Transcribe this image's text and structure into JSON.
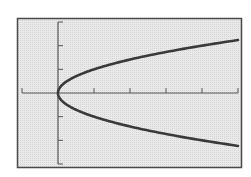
{
  "colors": {
    "background": "#ffffff",
    "screen": "#e6e6e6",
    "frame": "#4a4a4a",
    "axis": "#555555",
    "curve": "#3a3a3a"
  },
  "chart_data": {
    "type": "line",
    "title": "",
    "xlabel": "",
    "ylabel": "",
    "equation": "y^2 = x",
    "xlim": [
      -1,
      5
    ],
    "ylim": [
      -3,
      3
    ],
    "xscale": 1,
    "yscale": 1,
    "grid": false,
    "legend": null,
    "x_ticks": [
      -1,
      1,
      2,
      3,
      4,
      5
    ],
    "y_ticks": [
      -3,
      -2,
      -1,
      1,
      2,
      3
    ],
    "series": [
      {
        "name": "upper branch y = sqrt(x)",
        "x": [
          0,
          0.25,
          0.5,
          1,
          1.5,
          2,
          2.5,
          3,
          3.5,
          4,
          4.5,
          5
        ],
        "y": [
          0,
          0.5,
          0.707,
          1,
          1.225,
          1.414,
          1.581,
          1.732,
          1.871,
          2,
          2.121,
          2.236
        ]
      },
      {
        "name": "lower branch y = -sqrt(x)",
        "x": [
          0,
          0.25,
          0.5,
          1,
          1.5,
          2,
          2.5,
          3,
          3.5,
          4,
          4.5,
          5
        ],
        "y": [
          0,
          -0.5,
          -0.707,
          -1,
          -1.225,
          -1.414,
          -1.581,
          -1.732,
          -1.871,
          -2,
          -2.121,
          -2.236
        ]
      }
    ]
  }
}
